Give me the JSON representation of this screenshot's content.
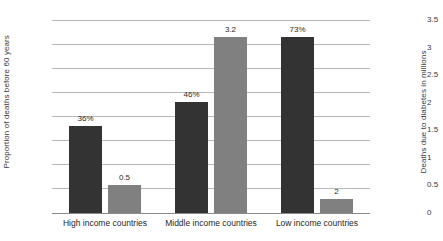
{
  "chart_data": {
    "type": "bar",
    "title": "",
    "subtitle": "",
    "categories": [
      "High income countries",
      "Middle income countries",
      "Low income countries"
    ],
    "series": [
      {
        "name": "Proportion of deaths before 60 years",
        "axis": "left",
        "color": "#333333",
        "values": [
          36,
          46,
          73
        ],
        "labels": [
          "36%",
          "46%",
          "73%"
        ]
      },
      {
        "name": "Deaths due to diabetes in millions",
        "axis": "right",
        "color": "#808080",
        "values": [
          0.5,
          3.2,
          0.25
        ],
        "labels": [
          "0.5",
          "3.2",
          "2"
        ]
      }
    ],
    "xlabel": "",
    "ylabel": "Proportion of deaths before 60 years",
    "ylabel_right": "Deaths due to diabetes in millions",
    "ylim": [
      0,
      80
    ],
    "ylim_right": [
      0,
      3.5
    ],
    "yticks": [
      "0%",
      "10%",
      "20%",
      "30%",
      "40%",
      "50%",
      "60%",
      "70%",
      "80%"
    ],
    "ytick_values": [
      0,
      10,
      20,
      30,
      40,
      50,
      60,
      70,
      80
    ],
    "yticks_right": [
      "0",
      "0.5",
      "1",
      "1.5",
      "2",
      "2.5",
      "3",
      "3.5"
    ],
    "ytick_values_right": [
      0,
      0.5,
      1,
      1.5,
      2,
      2.5,
      3,
      3.5
    ],
    "grid": true,
    "legend": false,
    "legend_position": "none",
    "background": "#ffffff",
    "gridline_color": "#b9b9b9",
    "axis_color": "#8a8a8a"
  }
}
